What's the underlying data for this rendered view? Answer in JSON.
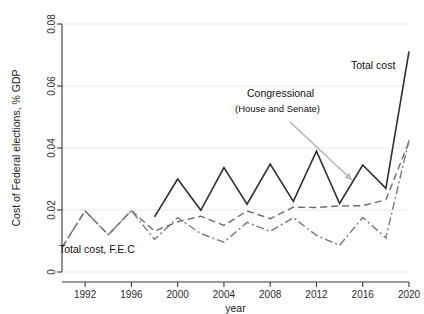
{
  "chart_data": {
    "type": "line",
    "title": "",
    "xlabel": "year",
    "ylabel": "Cost of Federal elections, % GDP",
    "xlim": [
      1990,
      2020
    ],
    "ylim": [
      0,
      0.08
    ],
    "grid": true,
    "legend_position": "inline-annotations",
    "x_ticks": [
      "1992",
      "1996",
      "2000",
      "2004",
      "2008",
      "2012",
      "2016",
      "2020"
    ],
    "x_tick_values": [
      1992,
      1996,
      2000,
      2004,
      2008,
      2012,
      2016,
      2020
    ],
    "y_ticks": [
      "0",
      "0.02",
      "0.04",
      "0.06",
      "0.08"
    ],
    "y_tick_values": [
      0,
      0.02,
      0.04,
      0.06,
      0.08
    ],
    "x": [
      1990,
      1992,
      1994,
      1996,
      1998,
      2000,
      2002,
      2004,
      2006,
      2008,
      2010,
      2012,
      2014,
      2016,
      2018,
      2020
    ],
    "series": [
      {
        "name": "Total cost",
        "style": "solid",
        "color": "#2f2f2f",
        "x": [
          1998,
          2000,
          2002,
          2004,
          2006,
          2008,
          2010,
          2012,
          2014,
          2016,
          2018,
          2020
        ],
        "values": [
          0.0178,
          0.03,
          0.0199,
          0.0337,
          0.0219,
          0.0348,
          0.0228,
          0.039,
          0.0221,
          0.0345,
          0.027,
          0.0712
        ]
      },
      {
        "name": "Congressional (House and Senate)",
        "style": "dashed",
        "color": "#6b6b6b",
        "x": [
          1990,
          1992,
          1994,
          1996,
          1998,
          2000,
          2002,
          2004,
          2006,
          2008,
          2010,
          2012,
          2014,
          2016,
          2018,
          2020
        ],
        "values": [
          0.0079,
          0.0197,
          0.012,
          0.0198,
          0.0132,
          0.0162,
          0.018,
          0.015,
          0.0197,
          0.0172,
          0.0209,
          0.0208,
          0.0213,
          0.0214,
          0.0233,
          0.042
        ]
      },
      {
        "name": "Total cost, F.E.C",
        "style": "dashdot",
        "color": "#7a7a7a",
        "x": [
          1990,
          1992,
          1994,
          1996,
          1998,
          2000,
          2002,
          2004,
          2006,
          2008,
          2010,
          2012,
          2014,
          2016,
          2018,
          2020
        ],
        "values": [
          0.0079,
          0.0197,
          0.012,
          0.0198,
          0.0105,
          0.0175,
          0.0124,
          0.0096,
          0.016,
          0.0131,
          0.0175,
          0.0118,
          0.0086,
          0.0176,
          0.011,
          0.0425
        ]
      }
    ],
    "annotations": [
      {
        "id": "total-cost",
        "text": "Total cost",
        "x_px": 351,
        "y_px": 69
      },
      {
        "id": "congressional",
        "text": "Congressional",
        "x_px": 247,
        "y_px": 97
      },
      {
        "id": "congressional-sub",
        "text": "(House and Senate)",
        "x_px": 235,
        "y_px": 112
      },
      {
        "id": "fec",
        "text": "Total cost, F.E.C",
        "x_px": 59,
        "y_px": 253
      }
    ],
    "leader_line": {
      "from_x_px": 290,
      "from_y_px": 122,
      "to_x_px": 352,
      "to_y_px": 180
    },
    "colors": {
      "axis": "#3a3a3a",
      "grid": "#f0f0f0",
      "background": "#ffffff",
      "total_cost": "#2f2f2f",
      "congressional": "#6b6b6b",
      "fec": "#7a7a7a",
      "leader": "#b8b8b8"
    }
  }
}
